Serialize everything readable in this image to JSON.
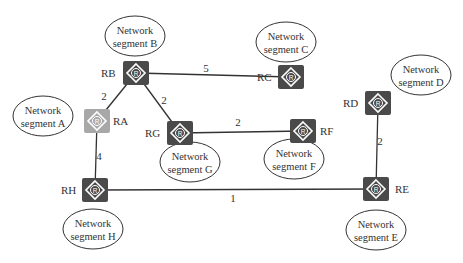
{
  "diagram": {
    "colors": {
      "router": "#4a4a4a",
      "router_highlight": "#a8a8a8",
      "link": "#333333",
      "text": "#333333"
    },
    "routers": [
      {
        "id": "RA",
        "label": "RA",
        "x": 97,
        "y": 121,
        "highlight": true,
        "label_dx": 16,
        "label_dy": 4
      },
      {
        "id": "RB",
        "label": "RB",
        "x": 136,
        "y": 73,
        "highlight": false,
        "label_dx": -35,
        "label_dy": 4
      },
      {
        "id": "RC",
        "label": "RC",
        "x": 291,
        "y": 77,
        "highlight": false,
        "label_dx": -34,
        "label_dy": 4
      },
      {
        "id": "RD",
        "label": "RD",
        "x": 378,
        "y": 103,
        "highlight": false,
        "label_dx": -35,
        "label_dy": 4
      },
      {
        "id": "RE",
        "label": "RE",
        "x": 376,
        "y": 189,
        "highlight": false,
        "label_dx": 19,
        "label_dy": 4
      },
      {
        "id": "RF",
        "label": "RF",
        "x": 303,
        "y": 131,
        "highlight": false,
        "label_dx": 17,
        "label_dy": 4
      },
      {
        "id": "RG",
        "label": "RG",
        "x": 180,
        "y": 133,
        "highlight": false,
        "label_dx": -35,
        "label_dy": 4
      },
      {
        "id": "RH",
        "label": "RH",
        "x": 95,
        "y": 190,
        "highlight": false,
        "label_dx": -34,
        "label_dy": 4
      }
    ],
    "segments": [
      {
        "id": "A",
        "line1": "Network",
        "line2": "segment A",
        "cx": 43,
        "cy": 116,
        "rx": 30,
        "ry": 20
      },
      {
        "id": "B",
        "line1": "Network",
        "line2": "segment B",
        "cx": 135,
        "cy": 36,
        "rx": 30,
        "ry": 20
      },
      {
        "id": "C",
        "line1": "Network",
        "line2": "segment C",
        "cx": 286,
        "cy": 42,
        "rx": 30,
        "ry": 20
      },
      {
        "id": "D",
        "line1": "Network",
        "line2": "segment D",
        "cx": 421,
        "cy": 75,
        "rx": 30,
        "ry": 20
      },
      {
        "id": "E",
        "line1": "Network",
        "line2": "segment E",
        "cx": 376,
        "cy": 230,
        "rx": 30,
        "ry": 20
      },
      {
        "id": "F",
        "line1": "Network",
        "line2": "segment F",
        "cx": 294,
        "cy": 159,
        "rx": 30,
        "ry": 20
      },
      {
        "id": "G",
        "line1": "Network",
        "line2": "segment G",
        "cx": 190,
        "cy": 162,
        "rx": 30,
        "ry": 20
      },
      {
        "id": "H",
        "line1": "Network",
        "line2": "segment H",
        "cx": 93,
        "cy": 229,
        "rx": 30,
        "ry": 20
      }
    ],
    "links": [
      {
        "from": "RA",
        "to": "RB",
        "cost": "2",
        "lx": 104,
        "ly": 100
      },
      {
        "from": "RB",
        "to": "RC",
        "cost": "5",
        "lx": 206,
        "ly": 72
      },
      {
        "from": "RB",
        "to": "RG",
        "cost": "2",
        "lx": 164,
        "ly": 104
      },
      {
        "from": "RG",
        "to": "RF",
        "cost": "2",
        "lx": 238,
        "ly": 126
      },
      {
        "from": "RA",
        "to": "RH",
        "cost": "4",
        "lx": 99,
        "ly": 160
      },
      {
        "from": "RH",
        "to": "RE",
        "cost": "1",
        "lx": 233,
        "ly": 202
      },
      {
        "from": "RD",
        "to": "RE",
        "cost": "2",
        "lx": 380,
        "ly": 145
      }
    ]
  }
}
